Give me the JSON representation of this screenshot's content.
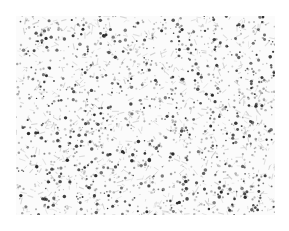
{
  "image": {
    "description": "grayscale speckle texture",
    "background_color": "#ffffff",
    "texture": {
      "x": 16,
      "y": 16,
      "width": 259,
      "height": 199,
      "base_color": "#fbfbfb",
      "dark_dot_color": "#2a2a2a",
      "mid_dot_color": "#8a8a8a",
      "light_fiber_color": "#c8c8c8",
      "dark_dot_count": 520,
      "mid_dot_count": 900,
      "fiber_count": 700,
      "seed": 1337
    }
  },
  "caption": {
    "text": ""
  }
}
